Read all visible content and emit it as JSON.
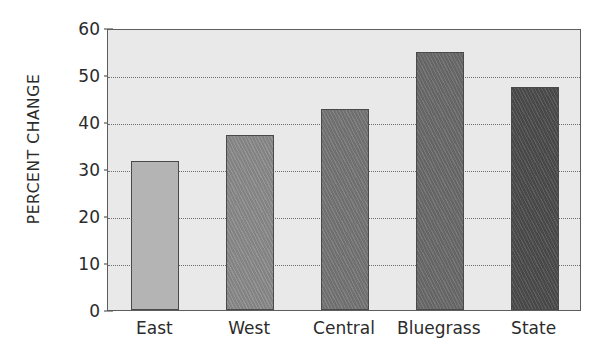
{
  "chart_data": {
    "type": "bar",
    "title": "",
    "subtitle": "",
    "xlabel": "",
    "ylabel": "PERCENT CHANGE",
    "categories": [
      "East",
      "West",
      "Central",
      "Bluegrass",
      "State"
    ],
    "values": [
      31.8,
      37.2,
      42.8,
      54.8,
      47.5
    ],
    "series": [
      {
        "name": "Percent change",
        "values": [
          31.8,
          37.2,
          42.8,
          54.8,
          47.5
        ]
      }
    ],
    "ylim": [
      0,
      60
    ],
    "yticks": [
      0,
      10,
      20,
      30,
      40,
      50,
      60
    ],
    "ytick_labels": [
      "0",
      "10",
      "20",
      "30",
      "40",
      "50",
      "60"
    ],
    "grid": true,
    "grid_axis": "y",
    "grid_style": "dotted",
    "legend": false,
    "legend_position": "none",
    "annotations": [],
    "bar_colors": [
      "#b4b4b4",
      "#8a8a8a",
      "#757575",
      "#6a6a6a",
      "#4c4c4c"
    ],
    "bar_textures": [
      "plain",
      "diagonal-hatch",
      "diagonal-hatch",
      "diagonal-hatch",
      "diagonal-hatch"
    ],
    "plot_background": "#e9e9e9",
    "page_background": "#ffffff",
    "axis_color": "#5d5d5d",
    "text_color": "#2b2b2b",
    "gridline_color": "#6e6e6e"
  }
}
